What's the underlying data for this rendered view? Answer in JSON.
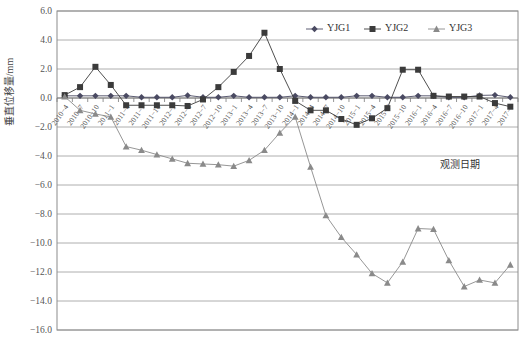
{
  "chart_data": {
    "type": "line",
    "title": "",
    "xlabel": "观测日期",
    "ylabel": "垂直位移量/mm",
    "ylim": [
      -16.0,
      6.0
    ],
    "ytick_step": 2.0,
    "yticks": [
      "6.0",
      "4.0",
      "2.0",
      "0.0",
      "-2.0",
      "-4.0",
      "-6.0",
      "-8.0",
      "-10.0",
      "-12.0",
      "-14.0",
      "-16.0"
    ],
    "grid": true,
    "legend_position": "top-right",
    "categories": [
      "2010-4",
      "2010-7",
      "2010-10",
      "2011-1",
      "2011-4",
      "2011-7",
      "2011-10",
      "2012-1",
      "2012-4",
      "2012-7",
      "2012-10",
      "2013-1",
      "2013-4",
      "2013-7",
      "2013-10",
      "2014-1",
      "2014-4",
      "2014-7",
      "2014-10",
      "2015-1",
      "2015-4",
      "2015-7",
      "2015-10",
      "2016-1",
      "2016-4",
      "2016-7",
      "2016-10",
      "2017-1",
      "2017-4",
      "2017-7"
    ],
    "xtick_labels": [
      "2010-4",
      "2010-7",
      "2010-10",
      "2011-1",
      "2011-4",
      "2011-7",
      "2011-10",
      "2012-1",
      "2012-4",
      "2012-7",
      "2012-10",
      "2013-1",
      "2013-4",
      "2013-7",
      "2013-10",
      "2014-1",
      "2014-4",
      "2014-7",
      "2014-10",
      "2015-1",
      "2015-4",
      "2015-7",
      "2015-10",
      "2016-1",
      "2016-4",
      "2016-7",
      "2016-10",
      "2017-1",
      "2017-4",
      "2017-7"
    ],
    "series": [
      {
        "name": "YJG1",
        "marker": "diamond",
        "color": "#4a4a62",
        "values": [
          0.15,
          0.15,
          0.15,
          0.15,
          0.15,
          0.05,
          0.05,
          0.05,
          0.18,
          0.05,
          0.05,
          0.15,
          0.05,
          0.05,
          0.05,
          0.15,
          0.05,
          0.05,
          0.05,
          0.15,
          0.15,
          0.05,
          0.05,
          0.15,
          0.15,
          0.05,
          0.05,
          0.18,
          0.2,
          0.05
        ]
      },
      {
        "name": "YJG2",
        "marker": "square",
        "color": "#3b3b3b",
        "values": [
          0.2,
          0.75,
          2.15,
          0.9,
          -0.5,
          -0.5,
          -0.5,
          -0.5,
          -0.55,
          -0.1,
          0.75,
          1.8,
          2.9,
          4.5,
          2.0,
          -0.2,
          -0.85,
          -0.85,
          -1.45,
          -1.85,
          -1.4,
          -0.7,
          1.95,
          1.95,
          0.15,
          0.1,
          0.1,
          0.1,
          -0.35,
          -0.6
        ]
      },
      {
        "name": "YJG3",
        "marker": "triangle",
        "color": "#8a8a8a",
        "values": [
          0.1,
          -0.85,
          -1.1,
          -1.3,
          -3.35,
          -3.6,
          -3.9,
          -4.2,
          -4.5,
          -4.55,
          -4.6,
          -4.7,
          -4.3,
          -3.6,
          -2.4,
          -1.3,
          -4.75,
          -8.1,
          -9.6,
          -10.8,
          -12.1,
          -12.75,
          -11.3,
          -9.0,
          -9.05,
          -11.2,
          -13.0,
          -12.55,
          -12.75,
          -11.5
        ]
      }
    ]
  },
  "legend": {
    "items": [
      {
        "label": "YJG1"
      },
      {
        "label": "YJG2"
      },
      {
        "label": "YJG3"
      }
    ]
  },
  "axes": {
    "y_axis_title": "垂直位移量/mm",
    "x_axis_title": "观测日期"
  }
}
